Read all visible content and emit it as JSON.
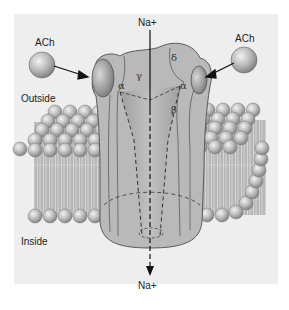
{
  "diagram": {
    "labels": {
      "ach_left": "ACh",
      "ach_right": "ACh",
      "na_top": "Na+",
      "na_bottom": "Na+",
      "outside": "Outside",
      "inside": "Inside"
    },
    "subunits": {
      "alpha_left": "α",
      "gamma": "γ",
      "delta": "δ",
      "alpha_right": "α",
      "beta": "β"
    },
    "colors": {
      "background": "#eeeeee",
      "protein": "#b8b8b8",
      "protein_dark": "#8f8f8f",
      "lipid_head": "#bdbdbd",
      "lipid_tail": "#a9a9a9",
      "outline": "#555555",
      "arrow": "#111111"
    }
  }
}
